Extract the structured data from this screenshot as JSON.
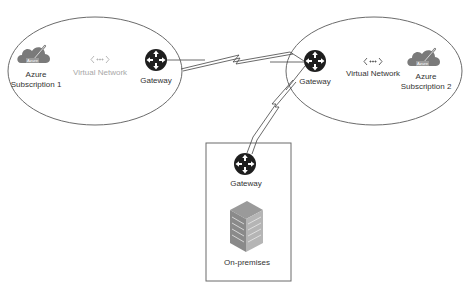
{
  "diagram": {
    "colors": {
      "outline": "#6b6b6b",
      "link": "#444444",
      "gateway": "#1e1e1e",
      "cloud": "#7a7a7a",
      "faded_text": "#a8a8a8",
      "text": "#333333"
    },
    "groups": [
      {
        "id": "subscription-1",
        "shape": "ellipse",
        "subscription": {
          "icon": "azure-cloud-icon",
          "badge": "Azure",
          "line1": "Azure",
          "line2": "Subscription 1"
        },
        "vnet": {
          "icon": "virtual-network-icon",
          "glyph": "<···>",
          "label": "Virtual Network",
          "faded": true
        },
        "gateway": {
          "icon": "gateway-router-icon",
          "label": "Gateway"
        }
      },
      {
        "id": "subscription-2",
        "shape": "ellipse",
        "subscription": {
          "icon": "azure-cloud-icon",
          "badge": "Azure",
          "line1": "Azure",
          "line2": "Subscription 2"
        },
        "vnet": {
          "icon": "virtual-network-icon",
          "glyph": "<···>",
          "label": "Virtual Network",
          "faded": false
        },
        "gateway": {
          "icon": "gateway-router-icon",
          "label": "Gateway"
        }
      },
      {
        "id": "on-premises",
        "shape": "rectangle",
        "gateway": {
          "icon": "gateway-router-icon",
          "label": "Gateway"
        },
        "site": {
          "icon": "building-icon",
          "label": "On-premises"
        }
      }
    ],
    "connections": [
      {
        "from": "subscription-1.gateway",
        "to": "subscription-2.gateway",
        "style": "lightning"
      },
      {
        "from": "subscription-2.gateway",
        "to": "on-premises.gateway",
        "style": "lightning"
      }
    ]
  }
}
